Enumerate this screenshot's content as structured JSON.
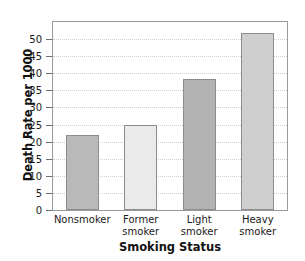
{
  "chart_data": {
    "type": "bar",
    "title": "",
    "xlabel": "Smoking Status",
    "ylabel": "Death Rate per 1000",
    "categories": [
      "Nonsmoker",
      "Former smoker",
      "Light smoker",
      "Heavy smoker"
    ],
    "category_lines": [
      [
        "Nonsmoker"
      ],
      [
        "Former",
        "smoker"
      ],
      [
        "Light",
        "smoker"
      ],
      [
        "Heavy",
        "smoker"
      ]
    ],
    "values": [
      22,
      25,
      38.5,
      52
    ],
    "ylim": [
      0,
      55
    ],
    "yticks": [
      0,
      5,
      10,
      15,
      20,
      25,
      30,
      35,
      40,
      45,
      50
    ],
    "ytick_labels": [
      "0",
      "5",
      "10",
      "15",
      "20",
      "25",
      "30",
      "35",
      "40",
      "45",
      "50"
    ],
    "grid": true,
    "legend": "none",
    "bar_colors": [
      "#b9b9b9",
      "#eaeaea",
      "#b2b2b2",
      "#cfcfcf"
    ],
    "bar_edge_color": "#8c8c8c",
    "frame_color": "#9a9a9a",
    "grid_color": "#cfcfcf"
  }
}
